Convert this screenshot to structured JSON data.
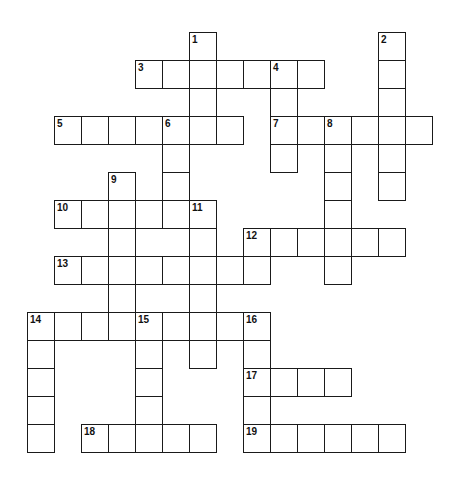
{
  "puzzle": {
    "type": "crossword",
    "cell_width": 27,
    "cell_height": 28,
    "origin_x": 27,
    "origin_y": 32,
    "border_color": "#1a1a1a",
    "entries": [
      {
        "number": 1,
        "direction": "down",
        "col": 6,
        "row": 0,
        "length": 4
      },
      {
        "number": 2,
        "direction": "down",
        "col": 13,
        "row": 0,
        "length": 6
      },
      {
        "number": 3,
        "direction": "across",
        "col": 4,
        "row": 1,
        "length": 7
      },
      {
        "number": 4,
        "direction": "down",
        "col": 9,
        "row": 1,
        "length": 4
      },
      {
        "number": 5,
        "direction": "across",
        "col": 1,
        "row": 3,
        "length": 7
      },
      {
        "number": 6,
        "direction": "down",
        "col": 5,
        "row": 3,
        "length": 4
      },
      {
        "number": 7,
        "direction": "across",
        "col": 9,
        "row": 3,
        "length": 6
      },
      {
        "number": 8,
        "direction": "down",
        "col": 11,
        "row": 3,
        "length": 6
      },
      {
        "number": 9,
        "direction": "down",
        "col": 3,
        "row": 5,
        "length": 6
      },
      {
        "number": 10,
        "direction": "across",
        "col": 1,
        "row": 6,
        "length": 6
      },
      {
        "number": 11,
        "direction": "down",
        "col": 6,
        "row": 6,
        "length": 6
      },
      {
        "number": 12,
        "direction": "across",
        "col": 8,
        "row": 7,
        "length": 6
      },
      {
        "number": 13,
        "direction": "across",
        "col": 1,
        "row": 8,
        "length": 8
      },
      {
        "number": 14,
        "direction": "across",
        "col": 0,
        "row": 10,
        "length": 9
      },
      {
        "number": 14,
        "direction": "down",
        "col": 0,
        "row": 10,
        "length": 5
      },
      {
        "number": 15,
        "direction": "down",
        "col": 4,
        "row": 10,
        "length": 4
      },
      {
        "number": 16,
        "direction": "down",
        "col": 8,
        "row": 10,
        "length": 5
      },
      {
        "number": 17,
        "direction": "across",
        "col": 8,
        "row": 12,
        "length": 4
      },
      {
        "number": 18,
        "direction": "across",
        "col": 2,
        "row": 14,
        "length": 5
      },
      {
        "number": 19,
        "direction": "across",
        "col": 8,
        "row": 14,
        "length": 6
      }
    ]
  }
}
